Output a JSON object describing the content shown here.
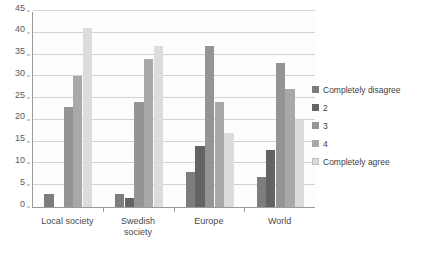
{
  "chart_data": {
    "type": "bar",
    "title": "",
    "subtitle": "",
    "xlabel": "",
    "ylabel": "",
    "ylim": [
      0,
      45
    ],
    "ytick_step": 5,
    "yticks": [
      0,
      5,
      10,
      15,
      20,
      25,
      30,
      35,
      40,
      45
    ],
    "grid": true,
    "legend_position": "right",
    "categories": [
      "Local society",
      "Swedish society",
      "Europe",
      "World"
    ],
    "series": [
      {
        "name": "Completely disagree",
        "color": "#7d7d7d",
        "values": [
          3,
          3,
          8,
          7
        ]
      },
      {
        "name": "2",
        "color": "#636363",
        "values": [
          0,
          2,
          14,
          13
        ]
      },
      {
        "name": "3",
        "color": "#949494",
        "values": [
          23,
          24,
          37,
          33
        ]
      },
      {
        "name": "4",
        "color": "#a8a8a8",
        "values": [
          30,
          34,
          24,
          27
        ]
      },
      {
        "name": "Completely agree",
        "color": "#dcdcdc",
        "values": [
          41,
          37,
          17,
          20
        ]
      }
    ]
  },
  "axis": {
    "y_tick_labels": [
      "0",
      "5",
      "10",
      "15",
      "20",
      "25",
      "30",
      "35",
      "40",
      "45"
    ],
    "x_tick_labels": [
      "Local society",
      "Swedish\nsociety",
      "Europe",
      "World"
    ]
  },
  "legend": {
    "entries": [
      {
        "label": "Completely disagree"
      },
      {
        "label": "2"
      },
      {
        "label": "3"
      },
      {
        "label": "4"
      },
      {
        "label": "Completely agree"
      }
    ]
  }
}
